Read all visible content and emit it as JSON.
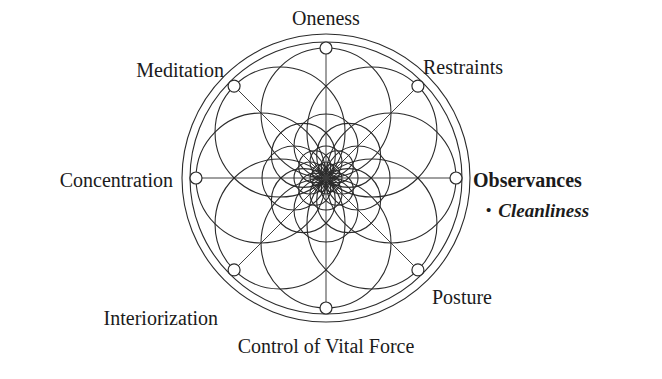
{
  "diagram": {
    "title_present": false,
    "type": "radial-mandala-eight-limbs",
    "center": {
      "x": 326,
      "y": 178
    },
    "radii": {
      "outer_circle": 144,
      "inner_circle": 136,
      "node_ring": 130
    },
    "stroke_color": "#2b2b2b",
    "background_color": "#ffffff",
    "node_count": 8,
    "node_radius": 6,
    "petal_rings": [
      {
        "circle_radius": 65,
        "center_distance": 65
      },
      {
        "circle_radius": 32,
        "center_distance": 32
      },
      {
        "circle_radius": 16,
        "center_distance": 16
      },
      {
        "circle_radius": 8,
        "center_distance": 8
      }
    ],
    "nodes": [
      {
        "id": "oneness",
        "label": "Oneness",
        "angle_deg": 270,
        "label_x": 326,
        "label_y": 18,
        "anchor": "mid",
        "emphasis": "normal"
      },
      {
        "id": "restraints",
        "label": "Restraints",
        "angle_deg": 315,
        "label_x": 423,
        "label_y": 67,
        "anchor": "start",
        "emphasis": "normal"
      },
      {
        "id": "observances",
        "label": "Observances",
        "angle_deg": 0,
        "label_x": 473,
        "label_y": 180,
        "anchor": "start",
        "emphasis": "strong"
      },
      {
        "id": "posture",
        "label": "Posture",
        "angle_deg": 45,
        "label_x": 432,
        "label_y": 297,
        "anchor": "start",
        "emphasis": "normal"
      },
      {
        "id": "control-vital-force",
        "label": "Control of Vital Force",
        "angle_deg": 90,
        "label_x": 326,
        "label_y": 346,
        "anchor": "mid",
        "emphasis": "normal"
      },
      {
        "id": "interiorization",
        "label": "Interiorization",
        "angle_deg": 135,
        "label_x": 218,
        "label_y": 318,
        "anchor": "end",
        "emphasis": "normal"
      },
      {
        "id": "concentration",
        "label": "Concentration",
        "angle_deg": 180,
        "label_x": 173,
        "label_y": 180,
        "anchor": "end",
        "emphasis": "normal"
      },
      {
        "id": "meditation",
        "label": "Meditation",
        "angle_deg": 225,
        "label_x": 224,
        "label_y": 70,
        "anchor": "end",
        "emphasis": "normal"
      }
    ],
    "sub_items": [
      {
        "parent": "observances",
        "bullet": "•",
        "label": "Cleanliness",
        "x": 486,
        "y": 200
      }
    ]
  }
}
